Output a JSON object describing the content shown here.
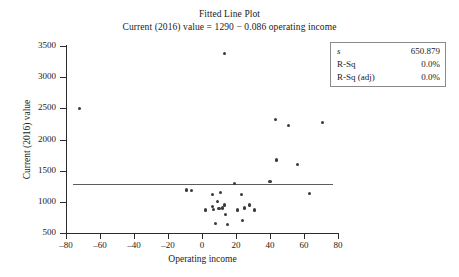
{
  "chart_data": {
    "type": "scatter",
    "title": "Fitted Line Plot",
    "subtitle": "Current (2016) value = 1290 − 0.086 operating income",
    "xlabel": "Operating income",
    "ylabel": "Current (2016) value",
    "xlim": [
      -80,
      80
    ],
    "ylim": [
      500,
      3500
    ],
    "xticks": [
      -80,
      -60,
      -40,
      -20,
      0,
      20,
      40,
      60,
      80
    ],
    "xtick_labels": [
      "–80",
      "–60",
      "–40",
      "–20",
      "0",
      "20",
      "40",
      "60",
      "80"
    ],
    "yticks": [
      500,
      1000,
      1500,
      2000,
      2500,
      3000,
      3500
    ],
    "ytick_labels": [
      "500",
      "1000",
      "1500",
      "2000",
      "2500",
      "3000",
      "3500"
    ],
    "grid": false,
    "legend": null,
    "fit_line": {
      "intercept": 1290,
      "slope": -0.086,
      "x_start": -76,
      "x_end": 77
    },
    "points": [
      {
        "x": -72,
        "y": 2500
      },
      {
        "x": -9,
        "y": 1190
      },
      {
        "x": -6,
        "y": 1180
      },
      {
        "x": 2,
        "y": 870
      },
      {
        "x": 6,
        "y": 920
      },
      {
        "x": 6,
        "y": 1120
      },
      {
        "x": 7,
        "y": 880
      },
      {
        "x": 8,
        "y": 650
      },
      {
        "x": 9,
        "y": 1000
      },
      {
        "x": 10,
        "y": 890
      },
      {
        "x": 11,
        "y": 1150
      },
      {
        "x": 12,
        "y": 900
      },
      {
        "x": 13,
        "y": 3380
      },
      {
        "x": 13,
        "y": 960
      },
      {
        "x": 13,
        "y": 940
      },
      {
        "x": 14,
        "y": 800
      },
      {
        "x": 15,
        "y": 640
      },
      {
        "x": 19,
        "y": 1290
      },
      {
        "x": 21,
        "y": 870
      },
      {
        "x": 23,
        "y": 1120
      },
      {
        "x": 24,
        "y": 700
      },
      {
        "x": 25,
        "y": 900
      },
      {
        "x": 28,
        "y": 950
      },
      {
        "x": 31,
        "y": 870
      },
      {
        "x": 40,
        "y": 1330
      },
      {
        "x": 43,
        "y": 2320
      },
      {
        "x": 44,
        "y": 1670
      },
      {
        "x": 51,
        "y": 2220
      },
      {
        "x": 56,
        "y": 1600
      },
      {
        "x": 63,
        "y": 1140
      },
      {
        "x": 71,
        "y": 2270
      }
    ]
  },
  "stats_box": {
    "rows": [
      {
        "key": "s",
        "value": "650.879",
        "italic_key": true
      },
      {
        "key": "R-Sq",
        "value": "0.0%",
        "italic_key": false
      },
      {
        "key": "R-Sq (adj)",
        "value": "0.0%",
        "italic_key": false
      }
    ]
  }
}
